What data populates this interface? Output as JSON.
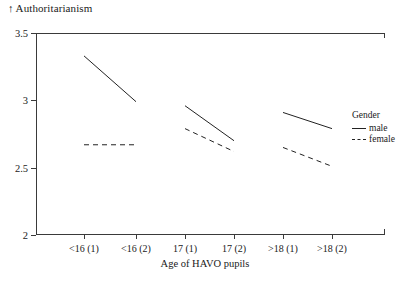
{
  "chart_data": {
    "type": "line",
    "title": "",
    "ylabel": "Authoritarianism",
    "ylabel_prefix": "↑",
    "xlabel": "Age of HAVO pupils",
    "categories": [
      "<16 (1)",
      "<16 (2)",
      "17 (1)",
      "17 (2)",
      ">18 (1)",
      ">18 (2)"
    ],
    "ylim": [
      2,
      3.5
    ],
    "yticks": [
      3.5,
      3,
      2.5,
      2
    ],
    "ytick_labels": [
      "3.5",
      "3",
      "2.5",
      "2"
    ],
    "grid": false,
    "legend_position": "right",
    "legend_title": "Gender",
    "series": [
      {
        "name": "male",
        "style": "solid",
        "values": [
          3.33,
          2.99,
          2.96,
          2.7,
          2.91,
          2.79
        ],
        "segments": [
          [
            0,
            1
          ],
          [
            2,
            3
          ],
          [
            4,
            5
          ]
        ]
      },
      {
        "name": "female",
        "style": "dashed",
        "values": [
          2.67,
          2.67,
          2.79,
          2.62,
          2.65,
          2.51
        ],
        "segments": [
          [
            0,
            1
          ],
          [
            2,
            3
          ],
          [
            4,
            5
          ]
        ]
      }
    ]
  },
  "legend": {
    "title": "Gender",
    "items": [
      {
        "label": "male",
        "style": "solid"
      },
      {
        "label": "female",
        "style": "dashed"
      }
    ]
  },
  "axes": {
    "y_axis_caption": "Authoritarianism",
    "y_arrow": "↑",
    "x_axis_caption": "Age of HAVO pupils"
  },
  "colors": {
    "line": "#222222",
    "axis": "#3a3a3a",
    "background": "#ffffff",
    "text": "#1a1a1a"
  }
}
